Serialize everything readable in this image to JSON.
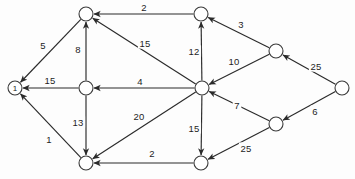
{
  "graph": {
    "title": "Directed weighted graph",
    "background_color": "#fdfdfd",
    "stroke_color": "#2a2a2a",
    "node_fill": "#ffffff",
    "node_radius": 7,
    "nodes": [
      {
        "id": "n1",
        "label": "1",
        "x": 15,
        "y": 88,
        "show_label": true
      },
      {
        "id": "n2",
        "label": "",
        "x": 86,
        "y": 14,
        "show_label": false
      },
      {
        "id": "n3",
        "label": "",
        "x": 86,
        "y": 88,
        "show_label": false
      },
      {
        "id": "n4",
        "label": "",
        "x": 86,
        "y": 163,
        "show_label": false
      },
      {
        "id": "n5",
        "label": "",
        "x": 201,
        "y": 14,
        "show_label": false
      },
      {
        "id": "n6",
        "label": "",
        "x": 202,
        "y": 88,
        "show_label": false
      },
      {
        "id": "n7",
        "label": "",
        "x": 201,
        "y": 163,
        "show_label": false
      },
      {
        "id": "n8",
        "label": "",
        "x": 276,
        "y": 51,
        "show_label": false
      },
      {
        "id": "n9",
        "label": "",
        "x": 276,
        "y": 124,
        "show_label": false
      },
      {
        "id": "n10",
        "label": "",
        "x": 342,
        "y": 88,
        "show_label": false
      }
    ],
    "edges": [
      {
        "id": "e-n2-n1",
        "from": "n2",
        "to": "n1",
        "weight": "5",
        "lx": 43,
        "ly": 45
      },
      {
        "id": "e-n3-n1",
        "from": "n3",
        "to": "n1",
        "weight": "15",
        "lx": 50,
        "ly": 80
      },
      {
        "id": "e-n4-n1",
        "from": "n4",
        "to": "n1",
        "weight": "1",
        "lx": 49,
        "ly": 139
      },
      {
        "id": "e-n3-n2",
        "from": "n3",
        "to": "n2",
        "weight": "8",
        "lx": 78,
        "ly": 49
      },
      {
        "id": "e-n3-n4",
        "from": "n3",
        "to": "n4",
        "weight": "13",
        "lx": 78,
        "ly": 122
      },
      {
        "id": "e-n5-n2",
        "from": "n5",
        "to": "n2",
        "weight": "2",
        "lx": 144,
        "ly": 7
      },
      {
        "id": "e-n6-n2",
        "from": "n6",
        "to": "n2",
        "weight": "15",
        "lx": 145,
        "ly": 43
      },
      {
        "id": "e-n6-n3",
        "from": "n6",
        "to": "n3",
        "weight": "4",
        "lx": 140,
        "ly": 81
      },
      {
        "id": "e-n6-n4",
        "from": "n6",
        "to": "n4",
        "weight": "20",
        "lx": 139,
        "ly": 116
      },
      {
        "id": "e-n6-n5",
        "from": "n6",
        "to": "n5",
        "weight": "12",
        "lx": 194,
        "ly": 51
      },
      {
        "id": "e-n6-n7",
        "from": "n6",
        "to": "n7",
        "weight": "15",
        "lx": 194,
        "ly": 128
      },
      {
        "id": "e-n7-n4",
        "from": "n7",
        "to": "n4",
        "weight": "2",
        "lx": 152,
        "ly": 153
      },
      {
        "id": "e-n8-n5",
        "from": "n8",
        "to": "n5",
        "weight": "3",
        "lx": 241,
        "ly": 24
      },
      {
        "id": "e-n8-n6",
        "from": "n8",
        "to": "n6",
        "weight": "10",
        "lx": 234,
        "ly": 61
      },
      {
        "id": "e-n9-n6",
        "from": "n9",
        "to": "n6",
        "weight": "7",
        "lx": 237,
        "ly": 105
      },
      {
        "id": "e-n9-n7",
        "from": "n9",
        "to": "n7",
        "weight": "25",
        "lx": 246,
        "ly": 148
      },
      {
        "id": "e-n10-n8",
        "from": "n10",
        "to": "n8",
        "weight": "25",
        "lx": 316,
        "ly": 66
      },
      {
        "id": "e-n10-n9",
        "from": "n10",
        "to": "n9",
        "weight": "6",
        "lx": 315,
        "ly": 111
      }
    ]
  }
}
